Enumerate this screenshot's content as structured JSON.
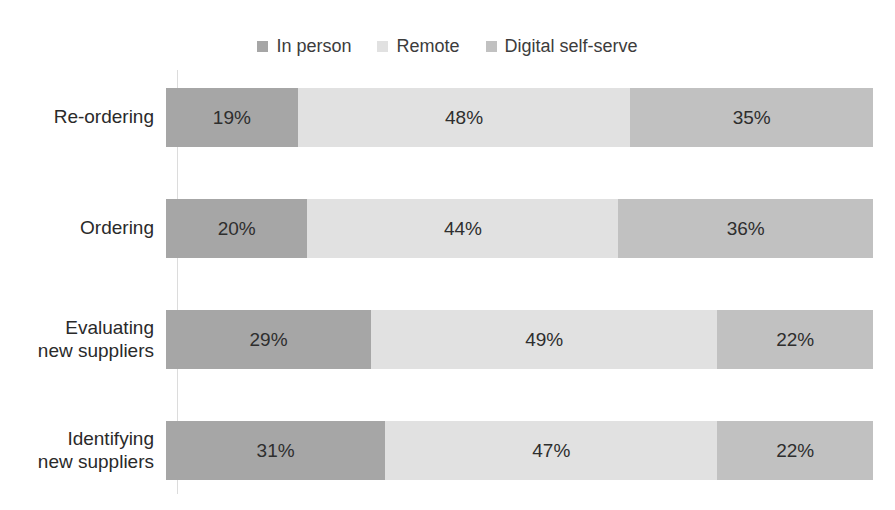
{
  "page": {
    "background": "#ffffff"
  },
  "chart_data": {
    "type": "bar",
    "orientation": "horizontal",
    "stacked": true,
    "unit": "percent",
    "title": "",
    "xlabel": "",
    "ylabel": "",
    "grid": false,
    "legend_position": "top",
    "axis_line_color": "#dcdcdc",
    "categories": [
      "Re-ordering",
      "Ordering",
      "Evaluating\nnew suppliers",
      "Identifying\nnew suppliers"
    ],
    "series": [
      {
        "name": "In person",
        "color": "#a6a6a6",
        "values": [
          19,
          20,
          29,
          31
        ]
      },
      {
        "name": "Remote",
        "color": "#e1e1e1",
        "values": [
          48,
          44,
          49,
          47
        ]
      },
      {
        "name": "Digital self-serve",
        "color": "#c1c1c1",
        "values": [
          35,
          36,
          22,
          22
        ]
      }
    ],
    "value_labels": [
      [
        "19%",
        "48%",
        "35%"
      ],
      [
        "20%",
        "44%",
        "36%"
      ],
      [
        "29%",
        "49%",
        "22%"
      ],
      [
        "31%",
        "47%",
        "22%"
      ]
    ],
    "value_label_format": "{v}%",
    "text_color": "#2e2e2e"
  }
}
